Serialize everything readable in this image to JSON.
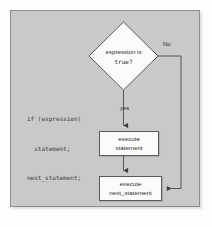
{
  "diagram": {
    "panel": {
      "background_color": "#c9c9c9",
      "border_color": "#8d8d8d"
    },
    "code_snippet": {
      "line1": "if (expression)",
      "line2": "  statement;",
      "line3": "next_statement;"
    },
    "decision": {
      "label_line1": "expression is",
      "label_line2": "true?",
      "shape": "diamond",
      "fill_color": "#fbfbfb",
      "border_color": "#5a5a5a"
    },
    "nodes": [
      {
        "id": "execute-statement",
        "line1": "execute",
        "line2": "statement",
        "shape": "rectangle",
        "fill_color": "#fbfbfb",
        "border_color": "#5a5a5a"
      },
      {
        "id": "execute-next-statement",
        "line1": "execute",
        "line2": "next_statement",
        "shape": "rectangle",
        "fill_color": "#fbfbfb",
        "border_color": "#5a5a5a"
      }
    ],
    "edges": {
      "no_label": "No",
      "yes_label": "yes",
      "line_color": "#4a4a4a"
    }
  }
}
